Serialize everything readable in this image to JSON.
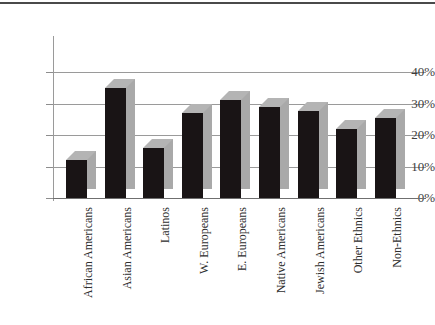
{
  "chart_data": {
    "type": "bar",
    "title": "",
    "xlabel": "",
    "ylabel": "",
    "ylim": [
      0,
      40
    ],
    "grid": true,
    "legend": "none",
    "style": "3d-column",
    "y_ticks": [
      "0%",
      "10%",
      "20%",
      "30%",
      "40%"
    ],
    "y_tick_values": [
      0,
      10,
      20,
      30,
      40
    ],
    "categories": [
      "African Americans",
      "Asian Americans",
      "Latinos",
      "W. Europeans",
      "E. Europeans",
      "Native Americans",
      "Jewish Americans",
      "Other Ethnics",
      "Non-Ethnics"
    ],
    "values": [
      12,
      35,
      16,
      27,
      31,
      29,
      27.5,
      22,
      25.5
    ],
    "value_unit": "percent"
  },
  "colors": {
    "bar_front": "#191415",
    "bar_side": "#a9a9a9",
    "bar_top": "#b4b4b4",
    "gridline": "#9a9a9a",
    "axis": "#6f6f6f",
    "label_text": "#2e2e2e",
    "tick_text": "#3d3d3d",
    "background": "#ffffff",
    "top_rule": "#4a4a4a"
  }
}
